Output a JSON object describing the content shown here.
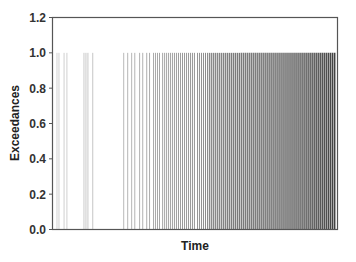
{
  "chart_data": {
    "type": "bar",
    "subtype": "exceedance-spikes",
    "title": "",
    "xlabel": "Time",
    "ylabel": "Exceedances",
    "ylim": [
      0.0,
      1.2
    ],
    "xlim": [
      0,
      1000
    ],
    "yticks": [
      0.0,
      0.2,
      0.4,
      0.6,
      0.8,
      1.0,
      1.2
    ],
    "ytick_labels": [
      "0.0",
      "0.2",
      "0.4",
      "0.6",
      "0.8",
      "1.0",
      "1.2"
    ],
    "xticks": [],
    "grid": false,
    "legend": null,
    "line_color": "#000000",
    "frame_color": "#555555",
    "series": [
      {
        "name": "Exceedances",
        "value": 1.0,
        "x": [
          14,
          21,
          39,
          49,
          109,
          116,
          123,
          140,
          249,
          263,
          277,
          288,
          305,
          316,
          330,
          340,
          354,
          361,
          368,
          375,
          386,
          393,
          400,
          407,
          414,
          421,
          428,
          435,
          442,
          449,
          456,
          463,
          470,
          477,
          484,
          491,
          498,
          509,
          516,
          523,
          530,
          537,
          544,
          551,
          558,
          565,
          572,
          579,
          586,
          593,
          600,
          607,
          614,
          621,
          628,
          635,
          642,
          649,
          656,
          663,
          670,
          677,
          684,
          691,
          698,
          705,
          712,
          719,
          726,
          733,
          740,
          747,
          754,
          761,
          768,
          775,
          782,
          789,
          796,
          803,
          810,
          817,
          824,
          831,
          838,
          845,
          852,
          859,
          866,
          873,
          880,
          887,
          894,
          901,
          908,
          915,
          922,
          929,
          936,
          943,
          950,
          957,
          964,
          971,
          978,
          985,
          992
        ],
        "density_note": "Events sparse early, increasingly dense toward the end of the time range"
      }
    ]
  }
}
